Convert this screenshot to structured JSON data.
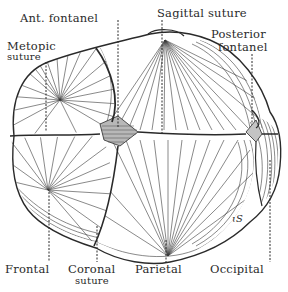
{
  "figure": {
    "ink_color": "#2a2a2a",
    "background": "#ffffff",
    "signature": "ɩS"
  },
  "labels": {
    "ant_fontanel": "Ant. fontanel",
    "sagittal_suture": "Sagittal suture",
    "metopic": "Metopic",
    "metopic_suture": "suture",
    "posterior": "Posterior",
    "posterior_fontanel": "fontanel",
    "frontal": "Frontal",
    "coronal": "Coronal",
    "coronal_suture": "suture",
    "parietal": "Parietal",
    "occipital": "Occipital"
  }
}
